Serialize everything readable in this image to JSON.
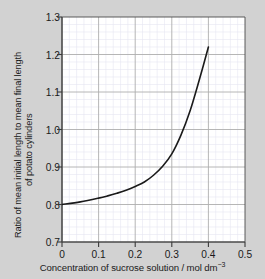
{
  "figure": {
    "background_color": "#d2d2d2",
    "plot_background_color": "#ffffff"
  },
  "chart_data": {
    "type": "line",
    "title": "",
    "xlabel_text": "Concentration of sucrose solution / mol dm",
    "xlabel_exponent": "−3",
    "xlabel": "Concentration of sucrose solution / mol dm⁻³",
    "ylabel": "Ratio of mean initial length to mean final length of potato cylinders",
    "ylabel_line1": "Ratio of mean initial length to mean final length",
    "ylabel_line2": "of potato cylinders",
    "xlim": [
      0,
      0.5
    ],
    "ylim": [
      0.7,
      1.3
    ],
    "xticks": [
      "0",
      "0.1",
      "0.2",
      "0.3",
      "0.4",
      "0.5"
    ],
    "xtick_values": [
      0,
      0.1,
      0.2,
      0.3,
      0.4,
      0.5
    ],
    "yticks": [
      "1.3",
      "1.2",
      "1.1",
      "1.0",
      "0.9",
      "0.8",
      "0.7"
    ],
    "ytick_values": [
      1.3,
      1.2,
      1.1,
      1.0,
      0.9,
      0.8,
      0.7
    ],
    "grid": true,
    "grid_major_step_x": 0.1,
    "grid_major_step_y": 0.1,
    "grid_minor_step_x": 0.02,
    "grid_minor_step_y": 0.02,
    "grid_major_color": "#b0b0b0",
    "grid_minor_color": "#e4e4f0",
    "legend": null,
    "line_color": "#1a1a1a",
    "line_width": 1.6,
    "x": [
      0.0,
      0.05,
      0.1,
      0.125,
      0.15,
      0.175,
      0.2,
      0.225,
      0.25,
      0.275,
      0.3,
      0.325,
      0.35,
      0.375,
      0.4
    ],
    "values": [
      0.8,
      0.807,
      0.817,
      0.823,
      0.83,
      0.838,
      0.848,
      0.86,
      0.878,
      0.902,
      0.935,
      0.985,
      1.05,
      1.132,
      1.22
    ],
    "series": [
      {
        "name": "potato cylinder length ratio",
        "x": [
          0.0,
          0.05,
          0.1,
          0.125,
          0.15,
          0.175,
          0.2,
          0.225,
          0.25,
          0.275,
          0.3,
          0.325,
          0.35,
          0.375,
          0.4
        ],
        "values": [
          0.8,
          0.807,
          0.817,
          0.823,
          0.83,
          0.838,
          0.848,
          0.86,
          0.878,
          0.902,
          0.935,
          0.985,
          1.05,
          1.132,
          1.22
        ]
      }
    ]
  }
}
